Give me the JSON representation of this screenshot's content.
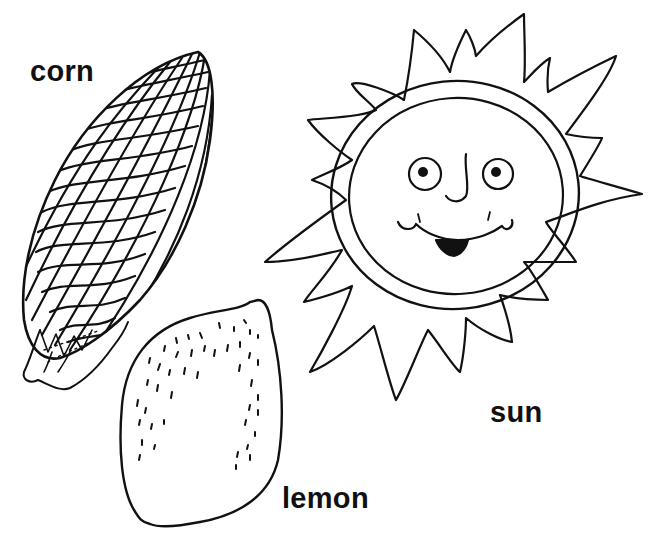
{
  "illustration": {
    "labels": {
      "corn": "corn",
      "sun": "sun",
      "lemon": "lemon"
    },
    "items": [
      {
        "id": "corn",
        "label": "corn",
        "description": "ear of corn with kernel grid and husk at base"
      },
      {
        "id": "sun",
        "label": "sun",
        "description": "smiling sun face with pointed rays"
      },
      {
        "id": "lemon",
        "label": "lemon",
        "description": "lemon outline with dotted texture"
      }
    ],
    "colors": {
      "ink": "#111111",
      "background": "#ffffff"
    }
  }
}
